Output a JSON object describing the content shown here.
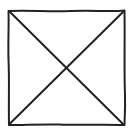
{
  "figure": {
    "icon": "image-placeholder-icon",
    "stroke_color": "#222222",
    "background_color": "#ffffff",
    "box": {
      "x1": 8,
      "y1": 10,
      "x2": 125,
      "y2": 125
    }
  }
}
